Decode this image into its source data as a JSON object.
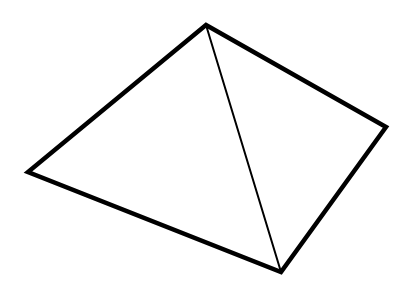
{
  "diagram": {
    "shape": "square pyramid (line drawing)",
    "stroke_color": "#000000",
    "background_color": "#ffffff",
    "vertices": {
      "apex": [
        206,
        25
      ],
      "left": [
        28,
        172
      ],
      "right": [
        386,
        127
      ],
      "bottom": [
        281,
        272
      ]
    },
    "outer_edges": [
      {
        "from": "apex",
        "to": "right"
      },
      {
        "from": "right",
        "to": "bottom"
      },
      {
        "from": "bottom",
        "to": "left"
      },
      {
        "from": "left",
        "to": "apex"
      }
    ],
    "inner_edges": [
      {
        "from": "apex",
        "to": "bottom"
      }
    ],
    "outer_stroke_width": 4.5,
    "inner_stroke_width": 2
  }
}
